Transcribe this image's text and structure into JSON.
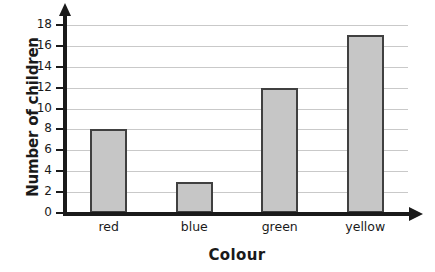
{
  "chart_data": {
    "type": "bar",
    "title": "",
    "categories": [
      "red",
      "blue",
      "green",
      "yellow"
    ],
    "values": [
      8,
      3,
      12,
      17
    ],
    "xlabel": "Colour",
    "ylabel": "Number of children",
    "ylim": [
      0,
      18
    ],
    "ytick_step": 2,
    "yticks": [
      0,
      2,
      4,
      6,
      8,
      10,
      12,
      14,
      16,
      18
    ],
    "ytick_labels": [
      "0",
      "2",
      "4",
      "6",
      "8",
      "10",
      "12",
      "14",
      "16",
      "18"
    ],
    "grid": true,
    "grid_axis": "y",
    "legend": false,
    "bar_fill": "#c6c6c6",
    "bar_border": "#404040",
    "axis_color": "#1a1a1a",
    "grid_color": "#c9c9c9",
    "background": "#ffffff"
  }
}
